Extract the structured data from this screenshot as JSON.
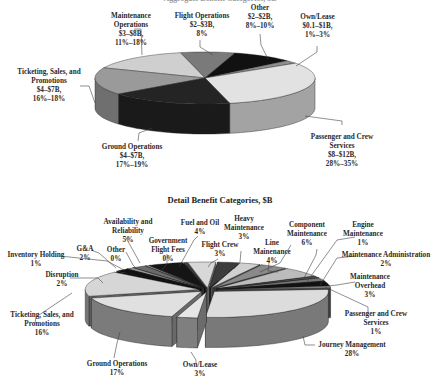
{
  "chart_data": [
    {
      "type": "pie",
      "style": "3d",
      "title": "Aggregate Benefit Categories, $B",
      "title_partially_visible": true,
      "slices": [
        {
          "label": "Flight Operations",
          "range": "$2–$3B",
          "pct": "8%",
          "value": 8,
          "color": "#7a7a7a"
        },
        {
          "label": "Other",
          "range": "$2–$2B",
          "pct": "8%–10%",
          "value": 9,
          "color": "#111111"
        },
        {
          "label": "Own/Lease",
          "range": "$0.1–$1B",
          "pct": "1%–3%",
          "value": 2,
          "color": "#8e8e8e"
        },
        {
          "label": "Passenger and Crew Services",
          "range": "$8–$12B",
          "pct": "28%–35%",
          "value": 31,
          "color": "#e2e2e2"
        },
        {
          "label": "Ground Operations",
          "range": "$4–$7B",
          "pct": "17%–19%",
          "value": 18,
          "color": "#242424"
        },
        {
          "label": "Ticketing, Sales, and Promotions",
          "range": "$4–$7B",
          "pct": "16%–18%",
          "value": 17,
          "color": "#9a9a9a"
        },
        {
          "label": "Maintenance Operations",
          "range": "$3–$8B",
          "pct": "11%–18%",
          "value": 15,
          "color": "#cfcfcf"
        }
      ]
    },
    {
      "type": "pie",
      "style": "3d-exploded",
      "title": "Detail Benefit Categories, $B",
      "slices": [
        {
          "label": "Fuel and Oil",
          "pct": "4%",
          "value": 4,
          "color": "#d8d8d8"
        },
        {
          "label": "Flight Crew",
          "pct": "3%",
          "value": 3,
          "color": "#3c3c3c"
        },
        {
          "label": "Heavy Maintenance",
          "pct": "3%",
          "value": 3,
          "color": "#d0d0d0"
        },
        {
          "label": "Line Mainenance",
          "pct": "4%",
          "value": 4,
          "color": "#8a8a8a"
        },
        {
          "label": "Component Maintenance",
          "pct": "6%",
          "value": 6,
          "color": "#bcbcbc"
        },
        {
          "label": "Engine Maintenance",
          "pct": "1%",
          "value": 1,
          "color": "#555555"
        },
        {
          "label": "Maintenance Administration",
          "pct": "2%",
          "value": 2,
          "color": "#777777"
        },
        {
          "label": "Maintenance Overhead",
          "pct": "3%",
          "value": 3,
          "color": "#111111"
        },
        {
          "label": "Passenger and Crew Services",
          "pct": "1%",
          "value": 1,
          "color": "#999999"
        },
        {
          "label": "Journey Management",
          "pct": "28%",
          "value": 28,
          "color": "#dcdcdc"
        },
        {
          "label": "Own/Lease",
          "pct": "3%",
          "value": 3,
          "color": "#e6e6e6"
        },
        {
          "label": "Ground Operations",
          "pct": "17%",
          "value": 17,
          "color": "#e0e0e0"
        },
        {
          "label": "Ticketing, Sales, and Promotions",
          "pct": "16%",
          "value": 16,
          "color": "#d6d6d6"
        },
        {
          "label": "Disruption",
          "pct": "2%",
          "value": 2,
          "color": "#111111"
        },
        {
          "label": "Inventory Holding",
          "pct": "1%",
          "value": 1,
          "color": "#9a9a9a"
        },
        {
          "label": "G&A",
          "pct": "2%",
          "value": 2,
          "color": "#6a6a6a"
        },
        {
          "label": "Other",
          "pct": "0%",
          "value": 0.4,
          "color": "#cccccc"
        },
        {
          "label": "Availability and Reliability",
          "pct": "5%",
          "value": 5,
          "color": "#151515"
        },
        {
          "label": "Government Flight Fees",
          "pct": "0%",
          "value": 0.4,
          "color": "#444444"
        }
      ]
    }
  ],
  "top": {
    "title": "Aggregate Benefit Categories, $B",
    "labels": {
      "maintenance": [
        "Maintenance",
        "Operations",
        "$3–$8B,",
        "11%–18%"
      ],
      "flight_ops": [
        "Flight Operations",
        "$2–$3B,",
        "8%"
      ],
      "other": [
        "Other",
        "$2–$2B,",
        "8%–10%"
      ],
      "own_lease": [
        "Own/Lease",
        "$0.1–$1B,",
        "1%–3%"
      ],
      "ticketing": [
        "Ticketing, Sales, and",
        "Promotions",
        "$4–$7B,",
        "16%–18%"
      ],
      "ground": [
        "Ground Operations",
        "$4–$7B,",
        "17%–19%"
      ],
      "passenger": [
        "Passenger and Crew",
        "Services",
        "$8–$12B,",
        "28%–35%"
      ]
    }
  },
  "detail": {
    "title": "Detail Benefit Categories, $B",
    "labels": {
      "availability": [
        "Availability and",
        "Reliability",
        "5%"
      ],
      "fuel": [
        "Fuel and Oil",
        "4%"
      ],
      "heavy": [
        "Heavy",
        "Maintenance",
        "3%"
      ],
      "component": [
        "Component",
        "Maintenance",
        "6%"
      ],
      "engine": [
        "Engine",
        "Maintenance",
        "1%"
      ],
      "gov": [
        "Government",
        "Flight Fees",
        "0%"
      ],
      "flight_crew": [
        "Flight Crew",
        "3%"
      ],
      "line": [
        "Line",
        "Mainenance",
        "4%"
      ],
      "maint_admin": [
        "Maintenance Administration",
        "2%"
      ],
      "ga": [
        "G&A",
        "2%"
      ],
      "other": [
        "Other",
        "0%"
      ],
      "inventory": [
        "Inventory Holding",
        "1%"
      ],
      "maint_overhead": [
        "Maintenance",
        "Overhead",
        "3%"
      ],
      "disruption": [
        "Disruption",
        "2%"
      ],
      "pcs": [
        "Passenger and Crew",
        "Services",
        "1%"
      ],
      "ticketing": [
        "Ticketing, Sales, and",
        "Promotions",
        "16%"
      ],
      "journey": [
        "Journey Management",
        "28%"
      ],
      "ground": [
        "Ground Operations",
        "17%"
      ],
      "own_lease": [
        "Own/Lease",
        "3%"
      ]
    }
  }
}
